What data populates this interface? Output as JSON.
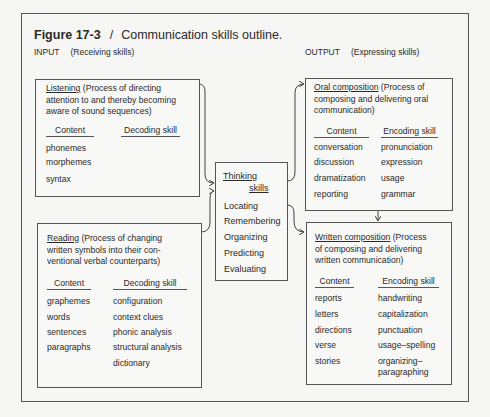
{
  "figure": {
    "number": "Figure 17-3",
    "separator": "/",
    "caption": "Communication skills outline."
  },
  "input": {
    "label": "INPUT",
    "sublabel": "(Receiving skills)",
    "listening": {
      "heading": "Listening",
      "description_line1": " (Process of directing",
      "description_line2": "attention to and thereby becoming",
      "description_line3": "aware of sound sequences)",
      "col_content": "Content",
      "col_skill": "Decoding skill",
      "content": [
        "phonemes",
        "morphemes",
        "syntax"
      ],
      "skills": []
    },
    "reading": {
      "heading": "Reading",
      "description_line1": " (Process of changing",
      "description_line2": "written symbols into their con-",
      "description_line3": "ventional verbal counterparts)",
      "col_content": "Content",
      "col_skill": "Decoding skill",
      "content": [
        "graphemes",
        "words",
        "sentences",
        "paragraphs"
      ],
      "skills": [
        "configuration",
        "context clues",
        "phonic analysis",
        "structural analysis",
        "dictionary"
      ]
    }
  },
  "thinking": {
    "heading_line1": "Thinking",
    "heading_line2": "skills",
    "items": [
      "Locating",
      "Remembering",
      "Organizing",
      "Predicting",
      "Evaluating"
    ]
  },
  "output": {
    "label": "OUTPUT",
    "sublabel": "(Expressing skills)",
    "oral": {
      "heading": "Oral composition",
      "description_line1": " (Process of",
      "description_line2": "composing and delivering oral",
      "description_line3": "communication)",
      "col_content": "Content",
      "col_skill": "Encoding skill",
      "content": [
        "conversation",
        "discussion",
        "dramatization",
        "reporting"
      ],
      "skills": [
        "pronunciation",
        "expression",
        "usage",
        "grammar"
      ]
    },
    "written": {
      "heading": "Written composition",
      "description_line1": " (Process",
      "description_line2": "of composing and delivering",
      "description_line3": "written communication)",
      "col_content": "Content",
      "col_skill": "Encoding skill",
      "content": [
        "reports",
        "letters",
        "directions",
        "verse",
        "stories"
      ],
      "skills": [
        "handwriting",
        "capitalization",
        "punctuation",
        "usage–spelling",
        "organizing–",
        "paragraphing"
      ]
    }
  }
}
